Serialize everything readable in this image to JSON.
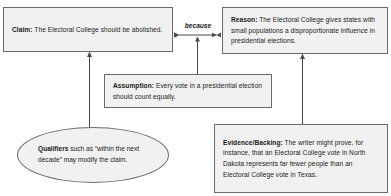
{
  "diagram": {
    "type": "toulmin-argument-map",
    "nodes": [
      {
        "id": "claim",
        "shape": "rectangle",
        "label_bold": "Claim:",
        "text": " The Electoral College should be abolished."
      },
      {
        "id": "reason",
        "shape": "rectangle",
        "label_bold": "Reason:",
        "text": " The Electoral College gives states with small populations a disproportionate influence in presidential elections."
      },
      {
        "id": "assumption",
        "shape": "rectangle",
        "label_bold": "Assumption:",
        "text": " Every vote in a presidential election should count equally."
      },
      {
        "id": "evidence",
        "shape": "rectangle",
        "label_bold": "Evidence/Backing:",
        "text": " The writer might prove, for instance, that an Electoral College vote in North Dakota represents far fewer people than an Electoral College vote in Texas."
      },
      {
        "id": "qualifiers",
        "shape": "ellipse",
        "label_bold": "Qualifiers",
        "text": " such as “within the next decade” may modify the claim."
      }
    ],
    "connectors": [
      {
        "id": "claim-reason",
        "label": "because",
        "style": "double-headed-horizontal-arrow",
        "from": "claim",
        "to": "reason"
      },
      {
        "id": "assumption-to-because",
        "label": "",
        "style": "single-headed-vertical-arrow-up",
        "from": "assumption",
        "to": "claim-reason"
      },
      {
        "id": "qualifiers-to-claim",
        "label": "",
        "style": "single-headed-vertical-arrow-up",
        "from": "qualifiers",
        "to": "claim"
      },
      {
        "id": "evidence-to-reason",
        "label": "",
        "style": "single-headed-vertical-arrow-up",
        "from": "evidence",
        "to": "reason"
      }
    ],
    "colors": {
      "node_fill": "#f1f1f1",
      "node_border": "#6b6b6b",
      "text": "#1a1a1a",
      "connector": "#4a4a4a",
      "background": "#ffffff"
    }
  }
}
